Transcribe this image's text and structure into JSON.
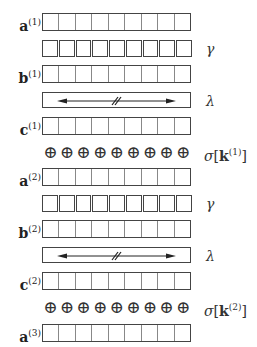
{
  "diagram": {
    "cells_per_vector": 9,
    "rows": [
      {
        "kind": "vector",
        "label_base": "a",
        "label_sup": "(1)"
      },
      {
        "kind": "squares",
        "right_label": "γ"
      },
      {
        "kind": "vector",
        "label_base": "b",
        "label_sup": "(1)"
      },
      {
        "kind": "lambda",
        "right_label": "λ"
      },
      {
        "kind": "vector",
        "label_base": "c",
        "label_sup": "(1)"
      },
      {
        "kind": "oplus",
        "right_sigma": "σ",
        "right_k": "k",
        "right_sup": "(1)"
      },
      {
        "kind": "vector",
        "label_base": "a",
        "label_sup": "(2)"
      },
      {
        "kind": "squares",
        "right_label": "γ"
      },
      {
        "kind": "vector",
        "label_base": "b",
        "label_sup": "(2)"
      },
      {
        "kind": "lambda",
        "right_label": "λ"
      },
      {
        "kind": "vector",
        "label_base": "c",
        "label_sup": "(2)"
      },
      {
        "kind": "oplus",
        "right_sigma": "σ",
        "right_k": "k",
        "right_sup": "(2)"
      },
      {
        "kind": "vector",
        "label_base": "a",
        "label_sup": "(3)"
      }
    ],
    "oplus_glyph": "⊕",
    "bracket_open": "[",
    "bracket_close": "]"
  }
}
